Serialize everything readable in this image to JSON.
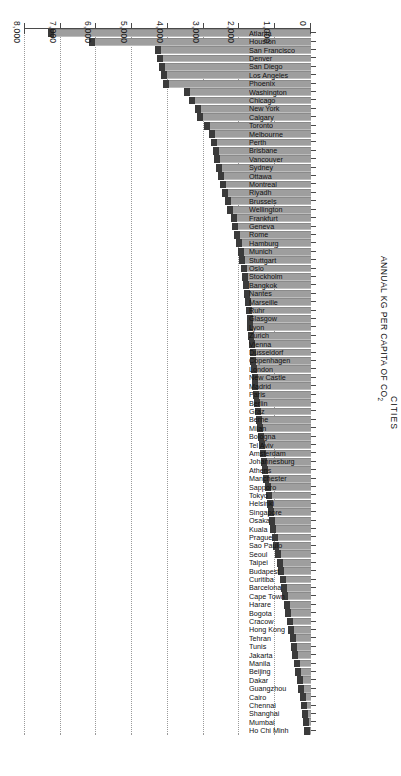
{
  "chart_data": {
    "type": "bar",
    "orientation": "horizontal",
    "title": "",
    "xlabel": "ANNUAL KG PER CAPITA OF CO2",
    "xlabel_sub": "2",
    "ylabel": "CITIES",
    "xlim": [
      0,
      8000
    ],
    "xticks": [
      0,
      1000,
      2000,
      3000,
      4000,
      5000,
      6000,
      7000,
      8000
    ],
    "xticklabels": [
      "0",
      "1,000",
      "2,000",
      "3,000",
      "4,000",
      "5,000",
      "6,000",
      "7,000",
      "8,000"
    ],
    "grid": true,
    "grid_style": "dotted",
    "legend": "none",
    "bar_color": "#9e9e9e",
    "bar_cap_color": "#3b3b3b",
    "categories": [
      "Atlanta",
      "Houston",
      "San Francisco",
      "Denver",
      "San Diego",
      "Los Angeles",
      "Phoenix",
      "Washington",
      "Chicago",
      "New York",
      "Calgary",
      "Toronto",
      "Melbourne",
      "Perth",
      "Brisbane",
      "Vancouver",
      "Sydney",
      "Ottawa",
      "Montreal",
      "Riyadh",
      "Brussels",
      "Wellington",
      "Frankfurt",
      "Geneva",
      "Rome",
      "Hamburg",
      "Munich",
      "Stuttgart",
      "Oslo",
      "Stockholm",
      "Bangkok",
      "Nantes",
      "Marseille",
      "Ruhr",
      "Glasgow",
      "Lyon",
      "Zurich",
      "Vienna",
      "Dusseldorf",
      "Copenhagen",
      "London",
      "New Castle",
      "Madrid",
      "Paris",
      "Berlin",
      "Graz",
      "Berne",
      "Milan",
      "Bologna",
      "Tel Aviv",
      "Amsterdam",
      "Johannesburg",
      "Athens",
      "Manchester",
      "Sapporo",
      "Tokyo",
      "Helsinki",
      "Singapore",
      "Osaka",
      "Kuala",
      "Prague",
      "Sao Paulo",
      "Seoul",
      "Taipei",
      "Budapest",
      "Curitiba",
      "Barcelona",
      "Cape Town",
      "Harare",
      "Bogota",
      "Cracow",
      "Hong Kong",
      "Tehran",
      "Tunis",
      "Jakarta",
      "Manila",
      "Beijing",
      "Dakar",
      "Guangzhou",
      "Cairo",
      "Chennai",
      "Shanghai",
      "Mumbai",
      "Ho Chi Minh"
    ],
    "values": [
      7350,
      6200,
      4350,
      4300,
      4250,
      4200,
      4150,
      3550,
      3400,
      3250,
      3200,
      3000,
      2850,
      2800,
      2750,
      2700,
      2650,
      2600,
      2550,
      2500,
      2400,
      2350,
      2250,
      2200,
      2150,
      2100,
      2050,
      2000,
      1960,
      1930,
      1900,
      1870,
      1840,
      1820,
      1800,
      1780,
      1760,
      1740,
      1720,
      1700,
      1680,
      1660,
      1640,
      1620,
      1600,
      1570,
      1540,
      1510,
      1480,
      1450,
      1420,
      1400,
      1370,
      1340,
      1300,
      1270,
      1240,
      1200,
      1170,
      1140,
      1100,
      1050,
      1000,
      960,
      920,
      880,
      840,
      800,
      760,
      720,
      680,
      640,
      600,
      560,
      520,
      480,
      440,
      400,
      360,
      320,
      290,
      260,
      230,
      200
    ]
  }
}
